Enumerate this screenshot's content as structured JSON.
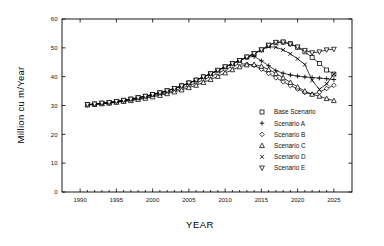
{
  "chart_data": {
    "type": "line",
    "title": "",
    "xlabel": "YEAR",
    "ylabel": "Million  cu m/Year",
    "xlim": [
      1987.5,
      2027.5
    ],
    "ylim": [
      0,
      60
    ],
    "xticks": [
      1990,
      1995,
      2000,
      2005,
      2010,
      2015,
      2020,
      2025
    ],
    "yticks": [
      0,
      10,
      20,
      30,
      40,
      50,
      60
    ],
    "grid": false,
    "legend_position": "inside-lower-right",
    "x": [
      1991,
      1992,
      1993,
      1994,
      1995,
      1996,
      1997,
      1998,
      1999,
      2000,
      2001,
      2002,
      2003,
      2004,
      2005,
      2006,
      2007,
      2008,
      2009,
      2010,
      2011,
      2012,
      2013,
      2014,
      2015,
      2016,
      2017,
      2018,
      2019,
      2020,
      2021,
      2022,
      2023,
      2024,
      2025
    ],
    "series": [
      {
        "name": "Base Scenario",
        "marker": "square-open",
        "values": [
          30.3,
          30.5,
          30.8,
          31.0,
          31.4,
          31.8,
          32.2,
          32.7,
          33.2,
          33.8,
          34.4,
          35.1,
          35.9,
          36.8,
          37.8,
          38.8,
          39.9,
          41.0,
          42.2,
          43.4,
          44.5,
          45.6,
          46.8,
          48.0,
          49.3,
          50.9,
          51.9,
          52.0,
          51.4,
          50.2,
          48.6,
          46.7,
          44.6,
          42.3,
          40.9
        ]
      },
      {
        "name": "Scenario A",
        "marker": "plus",
        "values": [
          30.3,
          30.5,
          30.8,
          31.0,
          31.4,
          31.8,
          32.2,
          32.7,
          33.2,
          33.8,
          34.4,
          35.1,
          35.9,
          36.8,
          37.8,
          38.8,
          39.9,
          41.0,
          42.2,
          43.4,
          44.5,
          45.6,
          46.8,
          47.0,
          45.5,
          43.8,
          42.1,
          41.2,
          40.6,
          40.2,
          39.9,
          39.7,
          39.5,
          39.3,
          39.0
        ]
      },
      {
        "name": "Scenario B",
        "marker": "diamond-open",
        "values": [
          30.2,
          30.4,
          30.6,
          30.9,
          31.2,
          31.5,
          31.9,
          32.3,
          32.8,
          33.3,
          33.9,
          34.5,
          35.2,
          36.0,
          36.9,
          37.8,
          38.9,
          40.0,
          41.2,
          42.4,
          43.5,
          44.5,
          44.3,
          43.9,
          42.6,
          41.1,
          39.6,
          38.2,
          36.9,
          35.7,
          34.5,
          33.9,
          34.6,
          35.9,
          37.0
        ]
      },
      {
        "name": "Scenario C",
        "marker": "triangle-up-open",
        "values": [
          30.2,
          30.4,
          30.6,
          30.8,
          31.1,
          31.4,
          31.7,
          32.1,
          32.5,
          33.0,
          33.5,
          34.1,
          34.7,
          35.4,
          36.2,
          37.0,
          38.0,
          39.0,
          40.1,
          41.3,
          42.4,
          43.4,
          44.1,
          44.2,
          43.6,
          42.5,
          41.1,
          39.6,
          38.0,
          36.4,
          35.0,
          33.9,
          33.2,
          32.4,
          31.7
        ]
      },
      {
        "name": "Scenario D",
        "marker": "x-cross",
        "values": [
          30.3,
          30.5,
          30.8,
          31.0,
          31.4,
          31.8,
          32.2,
          32.7,
          33.2,
          33.8,
          34.4,
          35.1,
          35.9,
          36.8,
          37.8,
          38.8,
          39.9,
          41.0,
          42.2,
          43.4,
          44.5,
          45.6,
          46.8,
          48.0,
          49.3,
          50.4,
          50.2,
          49.3,
          47.9,
          46.2,
          44.2,
          38.7,
          35.6,
          37.5,
          40.9
        ]
      },
      {
        "name": "Scenario E",
        "marker": "triangle-down-open",
        "values": [
          30.3,
          30.5,
          30.8,
          31.0,
          31.4,
          31.8,
          32.2,
          32.7,
          33.2,
          33.8,
          34.4,
          35.1,
          35.9,
          36.8,
          37.8,
          38.8,
          39.9,
          41.0,
          42.2,
          43.4,
          44.5,
          45.6,
          46.8,
          48.0,
          49.3,
          50.9,
          51.9,
          52.0,
          51.3,
          50.3,
          49.1,
          48.3,
          48.6,
          49.3,
          49.5
        ]
      }
    ]
  },
  "legend": {
    "items": [
      {
        "label": "Base Scenario",
        "marker": "square-open"
      },
      {
        "label": "Scenario A",
        "marker": "plus"
      },
      {
        "label": "Scenario B",
        "marker": "diamond-open"
      },
      {
        "label": "Scenario C",
        "marker": "triangle-up-open"
      },
      {
        "label": "Scenario D",
        "marker": "x-cross"
      },
      {
        "label": "Scenario E",
        "marker": "triangle-down-open"
      }
    ]
  },
  "colors": {
    "axis": "#000000",
    "line": "#000000",
    "marker_fill": "#ffffff",
    "background": "#ffffff"
  }
}
